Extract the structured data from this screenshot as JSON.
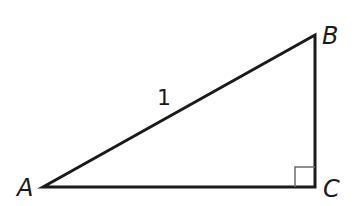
{
  "diagram": {
    "type": "right-triangle",
    "vertices": {
      "A": {
        "label": "A",
        "x": 43,
        "y": 187
      },
      "B": {
        "label": "B",
        "x": 315,
        "y": 35
      },
      "C": {
        "label": "C",
        "x": 315,
        "y": 187
      }
    },
    "right_angle_at": "C",
    "sides": {
      "AB": {
        "label": "1"
      }
    },
    "colors": {
      "stroke": "#1a1a1a",
      "right_angle_mark": "#6b6b6b",
      "background": "#ffffff"
    }
  }
}
